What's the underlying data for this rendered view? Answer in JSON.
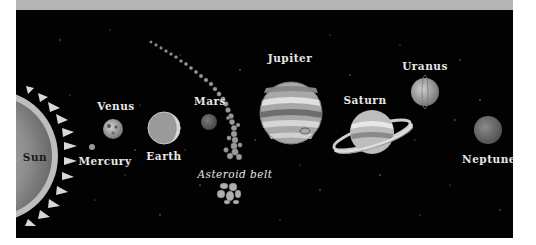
{
  "colors": {
    "background": "#020202",
    "top_band": "#b4b4b4",
    "label": "#e6e6e6"
  },
  "bodies": [
    {
      "name": "Sun",
      "label": "Sun"
    },
    {
      "name": "Mercury",
      "label": "Mercury"
    },
    {
      "name": "Venus",
      "label": "Venus"
    },
    {
      "name": "Earth",
      "label": "Earth"
    },
    {
      "name": "Mars",
      "label": "Mars"
    },
    {
      "name": "Asteroid belt",
      "label": "Asteroid belt"
    },
    {
      "name": "Jupiter",
      "label": "Jupiter"
    },
    {
      "name": "Saturn",
      "label": "Saturn"
    },
    {
      "name": "Uranus",
      "label": "Uranus"
    },
    {
      "name": "Neptune",
      "label": "Neptune"
    }
  ]
}
